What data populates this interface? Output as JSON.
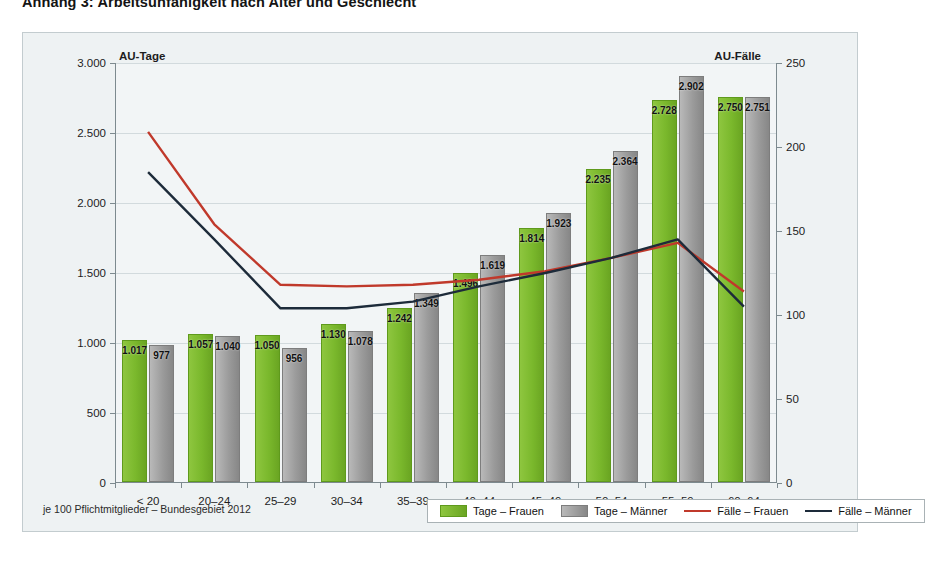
{
  "page_title": "Anhang 3: Arbeitsunfähigkeit nach Alter und Geschlecht",
  "footnote": "je 100 Pflichtmitglieder – Bundesgebiet 2012",
  "axis_title_left": "AU-Tage",
  "axis_title_right": "AU-Fälle",
  "legend": {
    "items": [
      {
        "label": "Tage – Frauen",
        "type": "bar",
        "color": "#7ab82c"
      },
      {
        "label": "Tage – Männer",
        "type": "bar",
        "color": "#9b9b9b"
      },
      {
        "label": "Fälle – Frauen",
        "type": "line",
        "color": "#c0392b"
      },
      {
        "label": "Fälle – Männer",
        "type": "line",
        "color": "#1d2b3a"
      }
    ]
  },
  "chart_data": {
    "type": "bar",
    "title": "Anhang 3: Arbeitsunfähigkeit nach Alter und Geschlecht",
    "subtitle": "je 100 Pflichtmitglieder – Bundesgebiet 2012",
    "xlabel": "",
    "ylabel": "AU-Tage",
    "y2label": "AU-Fälle",
    "ylim": [
      0,
      3000
    ],
    "y2lim": [
      0,
      250
    ],
    "yticks": [
      0,
      500,
      1000,
      1500,
      2000,
      2500,
      3000
    ],
    "ytick_labels": [
      "0",
      "500",
      "1.000",
      "1.500",
      "2.000",
      "2.500",
      "3.000"
    ],
    "y2ticks": [
      0,
      50,
      100,
      150,
      200,
      250
    ],
    "y2tick_labels": [
      "0",
      "50",
      "100",
      "150",
      "200",
      "250"
    ],
    "grid": true,
    "legend_position": "bottom",
    "categories": [
      "< 20",
      "20–24",
      "25–29",
      "30–34",
      "35–39",
      "40–44",
      "45–49",
      "50–54",
      "55–59",
      "60–64"
    ],
    "series": [
      {
        "name": "Tage – Frauen",
        "kind": "bar",
        "axis": "left",
        "color": "#7ab82c",
        "values": [
          1017,
          1057,
          1050,
          1130,
          1242,
          1496,
          1814,
          2235,
          2728,
          2750
        ],
        "labels": [
          "1.017",
          "1.057",
          "1.050",
          "1.130",
          "1.242",
          "1.496",
          "1.814",
          "2.235",
          "2.728",
          "2.750"
        ]
      },
      {
        "name": "Tage – Männer",
        "kind": "bar",
        "axis": "left",
        "color": "#9b9b9b",
        "values": [
          977,
          1040,
          956,
          1078,
          1349,
          1619,
          1923,
          2364,
          2902,
          2751
        ],
        "labels": [
          "977",
          "1.040",
          "956",
          "1.078",
          "1.349",
          "1.619",
          "1.923",
          "2.364",
          "2.902",
          "2.751"
        ]
      },
      {
        "name": "Fälle – Frauen",
        "kind": "line",
        "axis": "right",
        "color": "#c0392b",
        "values": [
          209,
          154,
          118,
          117,
          118,
          121,
          126,
          134,
          143,
          114
        ]
      },
      {
        "name": "Fälle – Männer",
        "kind": "line",
        "axis": "right",
        "color": "#1d2b3a",
        "values": [
          185,
          145,
          104,
          104,
          108,
          117,
          125,
          134,
          145,
          105
        ]
      }
    ]
  }
}
